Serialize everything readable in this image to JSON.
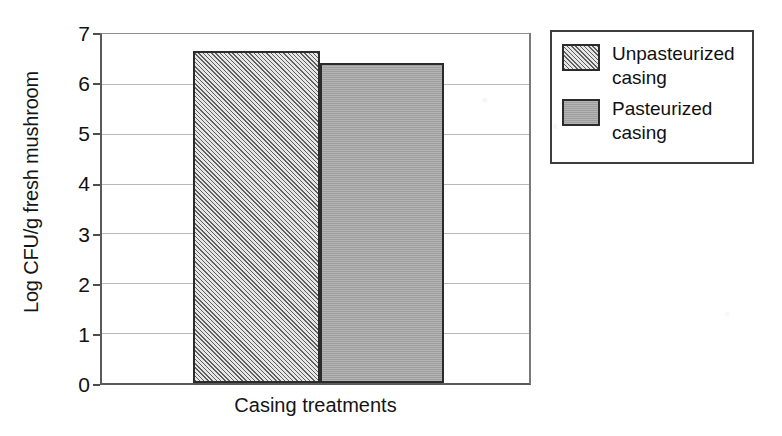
{
  "chart_data": {
    "type": "bar",
    "title": "",
    "subtitle": "",
    "xlabel": "Casing treatments",
    "ylabel": "Log CFU/g fresh mushroom",
    "categories": [
      "Unpasteurized casing",
      "Pasteurized casing"
    ],
    "values": [
      6.66,
      6.42
    ],
    "ylim": [
      0,
      7
    ],
    "ytick_labels": [
      "7",
      "6",
      "5",
      "4",
      "3",
      "2",
      "1",
      "0"
    ],
    "ytick_values": [
      7,
      6,
      5,
      4,
      3,
      2,
      1,
      0
    ],
    "grid": true,
    "grid_axis": "y",
    "legend_position": "right-outside",
    "series": [
      {
        "name": "Unpasteurized casing",
        "value": 6.66,
        "fill": "diagonal-hatch",
        "color": "#b4b4b4",
        "hatch_color": "#5f5f5f",
        "edge_color": "#2b2b2b"
      },
      {
        "name": "Pasteurized casing",
        "value": 6.42,
        "fill": "solid",
        "color": "#a6a6a6",
        "hatch_color": "",
        "edge_color": "#2b2b2b"
      }
    ],
    "legend": [
      {
        "label_line1": "Unpasteurized",
        "label_line2": "casing",
        "swatch": "diagonal-hatch"
      },
      {
        "label_line1": "Pasteurized",
        "label_line2": "casing",
        "swatch": "solid"
      }
    ],
    "axis_color": "#5a5a5a",
    "grid_color": "#b9b9b9",
    "background": "#ffffff"
  }
}
